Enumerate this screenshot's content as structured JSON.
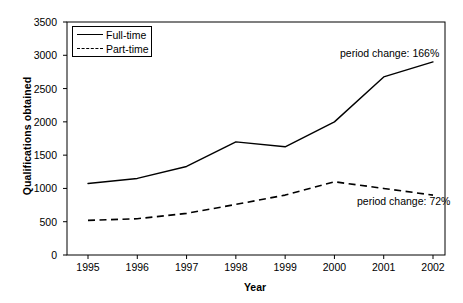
{
  "chart_data": {
    "type": "line",
    "title": "",
    "xlabel": "Year",
    "ylabel": "Qualifications obtained",
    "categories": [
      "1995",
      "1996",
      "1997",
      "1998",
      "1999",
      "2000",
      "2001",
      "2002"
    ],
    "x": [
      1995,
      1996,
      1997,
      1998,
      1999,
      2000,
      2001,
      2002
    ],
    "xlim": [
      1995,
      2002
    ],
    "ylim": [
      0,
      3500
    ],
    "yticks": [
      "0",
      "500",
      "1000",
      "1500",
      "2000",
      "2500",
      "3000",
      "3500"
    ],
    "ytick_values": [
      0,
      500,
      1000,
      1500,
      2000,
      2500,
      3000,
      3500
    ],
    "grid": false,
    "legend_position": "top-left",
    "series": [
      {
        "name": "Full-time",
        "style": "solid",
        "color": "#000000",
        "values": [
          1075,
          1150,
          1330,
          1700,
          1625,
          2000,
          2675,
          2900
        ]
      },
      {
        "name": "Part-time",
        "style": "dashed",
        "color": "#000000",
        "values": [
          520,
          545,
          625,
          760,
          900,
          1100,
          1000,
          900
        ]
      }
    ],
    "annotations": [
      {
        "id": "fulltime-change",
        "text": "period change: 166%"
      },
      {
        "id": "parttime-change",
        "text": "period change: 72%"
      }
    ]
  }
}
